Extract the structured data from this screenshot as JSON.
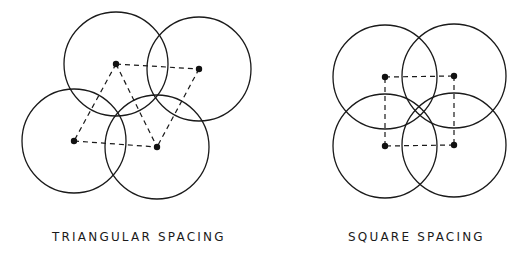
{
  "diagrams": [
    {
      "label": "TRIANGULAR SPACING",
      "radius": 52,
      "points": [
        [
          116,
          64
        ],
        [
          199,
          69
        ],
        [
          74,
          141
        ],
        [
          157,
          147
        ]
      ],
      "dashed_edges": [
        [
          0,
          1
        ],
        [
          0,
          2
        ],
        [
          0,
          3
        ],
        [
          1,
          3
        ],
        [
          2,
          3
        ]
      ]
    },
    {
      "label": "SQUARE SPACING",
      "radius": 52,
      "points": [
        [
          385,
          77
        ],
        [
          454,
          76
        ],
        [
          385,
          146
        ],
        [
          454,
          145
        ]
      ],
      "dashed_edges": [
        [
          0,
          1
        ],
        [
          1,
          3
        ],
        [
          3,
          2
        ],
        [
          2,
          0
        ]
      ]
    }
  ],
  "colors": {
    "stroke": "#1a1a1a",
    "background": "#ffffff"
  }
}
